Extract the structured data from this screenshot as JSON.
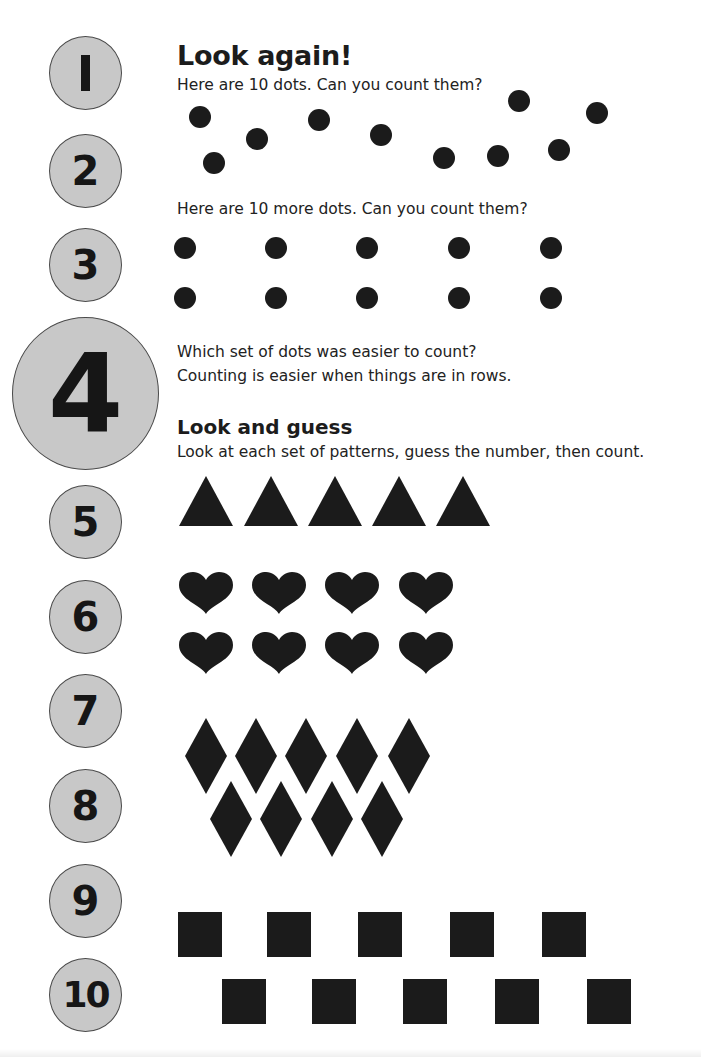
{
  "page": {
    "heading": "Look again!",
    "section_heading": "Look and guess"
  },
  "text": {
    "scattered_prompt": "Here are 10 dots. Can you count them?",
    "rows_prompt": "Here are 10 more dots. Can you count them?",
    "question": "Which set of dots was easier to count?",
    "explanation": "Counting is easier when things are in rows.",
    "instruction": "Look at each set of patterns, guess the number, then count."
  },
  "number_circles": [
    "1",
    "2",
    "3",
    "4",
    "5",
    "6",
    "7",
    "8",
    "9",
    "10"
  ],
  "colors": {
    "circle_fill": "#c8c8c8",
    "circle_border": "#4a4a4a",
    "shape_fill": "#1b1b1b"
  },
  "patterns": {
    "scattered_dots": {
      "shape": "circle",
      "count": 10
    },
    "row_dots": {
      "shape": "circle",
      "count": 10,
      "rows": 2,
      "per_row": 5
    },
    "triangles": {
      "shape": "triangle",
      "count": 5
    },
    "hearts": {
      "shape": "heart",
      "count": 8,
      "rows": 2,
      "per_row": 4
    },
    "diamonds": {
      "shape": "diamond",
      "count": 9,
      "rows": [
        5,
        4
      ]
    },
    "squares": {
      "shape": "square",
      "count": 10,
      "rows": [
        5,
        5
      ]
    }
  }
}
